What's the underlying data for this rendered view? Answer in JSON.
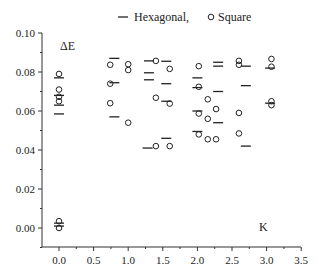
{
  "chart_data": {
    "type": "scatter",
    "title": "",
    "xlabel": "K",
    "ylabel": "ΔE",
    "xlim": [
      -0.25,
      3.5
    ],
    "ylim": [
      -0.01,
      0.1
    ],
    "xticks": [
      "0.0",
      "0.5",
      "1.0",
      "1.5",
      "2.0",
      "2.5",
      "3.0",
      "3.5"
    ],
    "yticks": [
      "0.00",
      "0.02",
      "0.04",
      "0.06",
      "0.08",
      "0.10"
    ],
    "grid": false,
    "legend": {
      "position": "top",
      "entries": [
        {
          "label": "Hexagonal,",
          "marker": "dash"
        },
        {
          "label": "Square",
          "marker": "open-circle"
        }
      ]
    },
    "series": [
      {
        "name": "Hexagonal",
        "marker": "dash",
        "points": [
          [
            0.0,
            0.077
          ],
          [
            0.0,
            0.068
          ],
          [
            0.0,
            0.063
          ],
          [
            0.0,
            0.0585
          ],
          [
            0.0,
            0.0025
          ],
          [
            0.0,
            0.001
          ],
          [
            0.8,
            0.087
          ],
          [
            0.8,
            0.0745
          ],
          [
            0.8,
            0.057
          ],
          [
            1.3,
            0.0857
          ],
          [
            1.3,
            0.0796
          ],
          [
            1.3,
            0.076
          ],
          [
            1.28,
            0.041
          ],
          [
            1.55,
            0.0855
          ],
          [
            1.55,
            0.074
          ],
          [
            1.55,
            0.065
          ],
          [
            1.55,
            0.046
          ],
          [
            2.0,
            0.077
          ],
          [
            2.0,
            0.072
          ],
          [
            2.0,
            0.06
          ],
          [
            2.0,
            0.0495
          ],
          [
            2.3,
            0.085
          ],
          [
            2.3,
            0.083
          ],
          [
            2.3,
            0.07
          ],
          [
            2.3,
            0.054
          ],
          [
            2.7,
            0.083
          ],
          [
            2.7,
            0.073
          ],
          [
            2.7,
            0.042
          ],
          [
            3.05,
            0.082
          ],
          [
            3.05,
            0.064
          ]
        ]
      },
      {
        "name": "Square",
        "marker": "open-circle",
        "points": [
          [
            0.0,
            0.079
          ],
          [
            0.0,
            0.071
          ],
          [
            0.0,
            0.0673
          ],
          [
            0.0,
            0.065
          ],
          [
            0.0,
            0.0035
          ],
          [
            0.0,
            0.0
          ],
          [
            0.74,
            0.0837
          ],
          [
            0.74,
            0.074
          ],
          [
            0.74,
            0.064
          ],
          [
            1.0,
            0.084
          ],
          [
            1.0,
            0.081
          ],
          [
            1.0,
            0.054
          ],
          [
            1.4,
            0.0857
          ],
          [
            1.4,
            0.0668
          ],
          [
            1.4,
            0.042
          ],
          [
            1.6,
            0.0816
          ],
          [
            1.6,
            0.0638
          ],
          [
            1.6,
            0.042
          ],
          [
            2.02,
            0.083
          ],
          [
            2.02,
            0.0724
          ],
          [
            2.02,
            0.0587
          ],
          [
            2.02,
            0.048
          ],
          [
            2.15,
            0.066
          ],
          [
            2.15,
            0.056
          ],
          [
            2.15,
            0.0455
          ],
          [
            2.27,
            0.061
          ],
          [
            2.27,
            0.0455
          ],
          [
            2.6,
            0.0857
          ],
          [
            2.6,
            0.0837
          ],
          [
            2.6,
            0.059
          ],
          [
            2.6,
            0.0485
          ],
          [
            3.07,
            0.0867
          ],
          [
            3.07,
            0.0827
          ],
          [
            3.07,
            0.065
          ],
          [
            3.07,
            0.063
          ]
        ]
      }
    ]
  },
  "labels": {
    "y_axis_title": "ΔE",
    "x_axis_title": "K",
    "legend_hex": "Hexagonal,",
    "legend_square": "Square"
  }
}
